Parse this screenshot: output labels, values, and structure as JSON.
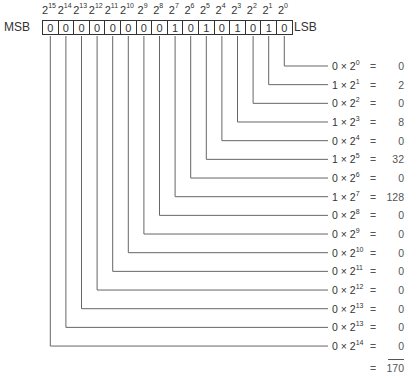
{
  "labels": {
    "msb": "MSB",
    "lsb": "LSB",
    "times": "×",
    "equals": "="
  },
  "bits": [
    {
      "exp": "15",
      "bit": "0"
    },
    {
      "exp": "14",
      "bit": "0"
    },
    {
      "exp": "13",
      "bit": "0"
    },
    {
      "exp": "12",
      "bit": "0"
    },
    {
      "exp": "11",
      "bit": "0"
    },
    {
      "exp": "10",
      "bit": "0"
    },
    {
      "exp": "9",
      "bit": "0"
    },
    {
      "exp": "8",
      "bit": "0"
    },
    {
      "exp": "7",
      "bit": "1"
    },
    {
      "exp": "6",
      "bit": "0"
    },
    {
      "exp": "5",
      "bit": "1"
    },
    {
      "exp": "4",
      "bit": "0"
    },
    {
      "exp": "3",
      "bit": "1"
    },
    {
      "exp": "2",
      "bit": "0"
    },
    {
      "exp": "1",
      "bit": "1"
    },
    {
      "exp": "0",
      "bit": "0"
    }
  ],
  "terms": [
    {
      "bit": "0",
      "exp": "0",
      "value": "0"
    },
    {
      "bit": "1",
      "exp": "1",
      "value": "2"
    },
    {
      "bit": "0",
      "exp": "2",
      "value": "0"
    },
    {
      "bit": "1",
      "exp": "3",
      "value": "8"
    },
    {
      "bit": "0",
      "exp": "4",
      "value": "0"
    },
    {
      "bit": "1",
      "exp": "5",
      "value": "32"
    },
    {
      "bit": "0",
      "exp": "6",
      "value": "0"
    },
    {
      "bit": "1",
      "exp": "7",
      "value": "128"
    },
    {
      "bit": "0",
      "exp": "8",
      "value": "0"
    },
    {
      "bit": "0",
      "exp": "9",
      "value": "0"
    },
    {
      "bit": "0",
      "exp": "10",
      "value": "0"
    },
    {
      "bit": "0",
      "exp": "11",
      "value": "0"
    },
    {
      "bit": "0",
      "exp": "12",
      "value": "0"
    },
    {
      "bit": "0",
      "exp": "13",
      "value": "0"
    },
    {
      "bit": "0",
      "exp": "13",
      "value": "0"
    },
    {
      "bit": "0",
      "exp": "14",
      "value": "0"
    }
  ],
  "total": "170"
}
